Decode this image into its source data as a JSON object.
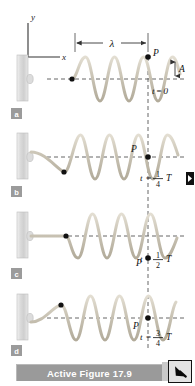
{
  "figure": {
    "caption": "Active Figure 17.9",
    "axes": {
      "y_label": "y",
      "x_label": "x"
    },
    "wavelength_label": "λ",
    "amplitude_label": "A",
    "point_label": "P",
    "panels": [
      {
        "id": "a",
        "panel_label": "a",
        "time_label": "t = 0",
        "time_var": "t",
        "time_eq": "=",
        "time_value": "0",
        "time_frac_num": "",
        "time_frac_den": "",
        "time_period": "",
        "p_position": "crest",
        "phase_deg": 0
      },
      {
        "id": "b",
        "panel_label": "b",
        "time_label": "t = 1/4 T",
        "time_var": "t",
        "time_eq": "=",
        "time_value": "",
        "time_frac_num": "1",
        "time_frac_den": "4",
        "time_period": "T",
        "p_position": "zero-descending",
        "phase_deg": 90
      },
      {
        "id": "c",
        "panel_label": "c",
        "time_label": "t = 1/2 T",
        "time_var": "t",
        "time_eq": "=",
        "time_value": "",
        "time_frac_num": "1",
        "time_frac_den": "2",
        "time_period": "T",
        "p_position": "trough",
        "phase_deg": 180
      },
      {
        "id": "d",
        "panel_label": "d",
        "time_label": "t = 3/4 T",
        "time_var": "t",
        "time_eq": "=",
        "time_value": "",
        "time_frac_num": "3",
        "time_frac_den": "4",
        "time_period": "T",
        "p_position": "zero-ascending",
        "phase_deg": 270
      }
    ],
    "colors": {
      "wave": "#c9c3b4",
      "wall": "#d7d7d7",
      "string": "#c9c3b4",
      "dashed": "#555555",
      "point": "#111111",
      "caption_bar": "#9a9a9a",
      "caption_text": "#ffffff",
      "panel_badge": "#9b9b9b",
      "background": "#ffffff"
    }
  }
}
